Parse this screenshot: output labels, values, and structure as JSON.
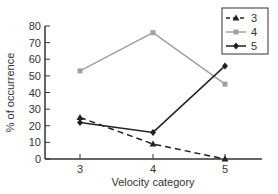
{
  "chart_data": {
    "type": "line",
    "title": "",
    "xlabel": "Velocity category",
    "ylabel": "% of occurrence",
    "categories": [
      "3",
      "4",
      "5"
    ],
    "ylim": [
      0,
      80
    ],
    "yticks": [
      0,
      10,
      20,
      30,
      40,
      50,
      60,
      70,
      80
    ],
    "grid": false,
    "legend_position": "top-right",
    "series": [
      {
        "name": "3",
        "values": [
          25,
          9,
          0
        ],
        "style": "dashed",
        "marker": "triangle",
        "color": "#222222"
      },
      {
        "name": "4",
        "values": [
          53,
          76,
          45
        ],
        "style": "solid",
        "marker": "square",
        "color": "#a0a0a0"
      },
      {
        "name": "5",
        "values": [
          22,
          16,
          56
        ],
        "style": "solid",
        "marker": "diamond",
        "color": "#222222"
      }
    ]
  },
  "labels": {
    "xlabel": "Velocity category",
    "ylabel": "% of occurrence",
    "legend": [
      "3",
      "4",
      "5"
    ]
  }
}
